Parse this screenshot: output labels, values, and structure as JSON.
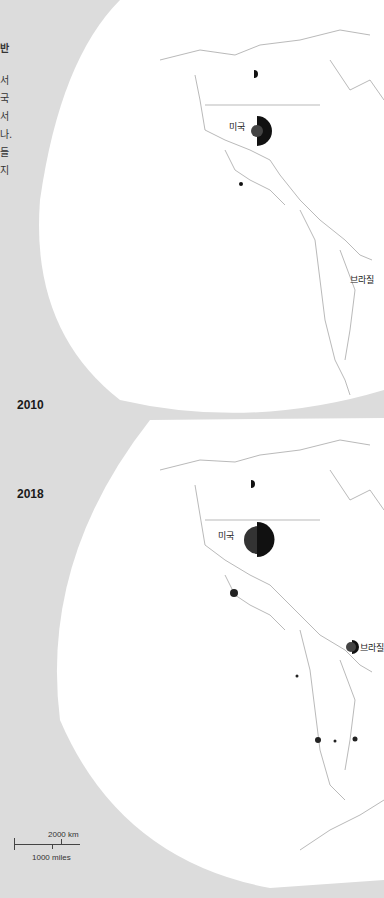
{
  "sidebar_text": {
    "title_fragment": "반",
    "lines": [
      "서",
      "국",
      "서",
      "나.",
      "들",
      "지"
    ]
  },
  "maps": [
    {
      "year": "2010",
      "labels": [
        {
          "text": "미국",
          "country": "United States"
        },
        {
          "text": "브라질",
          "country": "Brazil"
        }
      ]
    },
    {
      "year": "2018",
      "labels": [
        {
          "text": "미국",
          "country": "United States"
        },
        {
          "text": "브라질",
          "country": "Brazil"
        }
      ]
    }
  ],
  "scale_bar": {
    "km_label": "2000 km",
    "miles_label": "1000 miles"
  },
  "colors": {
    "background": "#dcdcdc",
    "land": "#ffffff",
    "border": "#888888",
    "symbol_dark": "#111111",
    "symbol_mid": "#444444"
  }
}
